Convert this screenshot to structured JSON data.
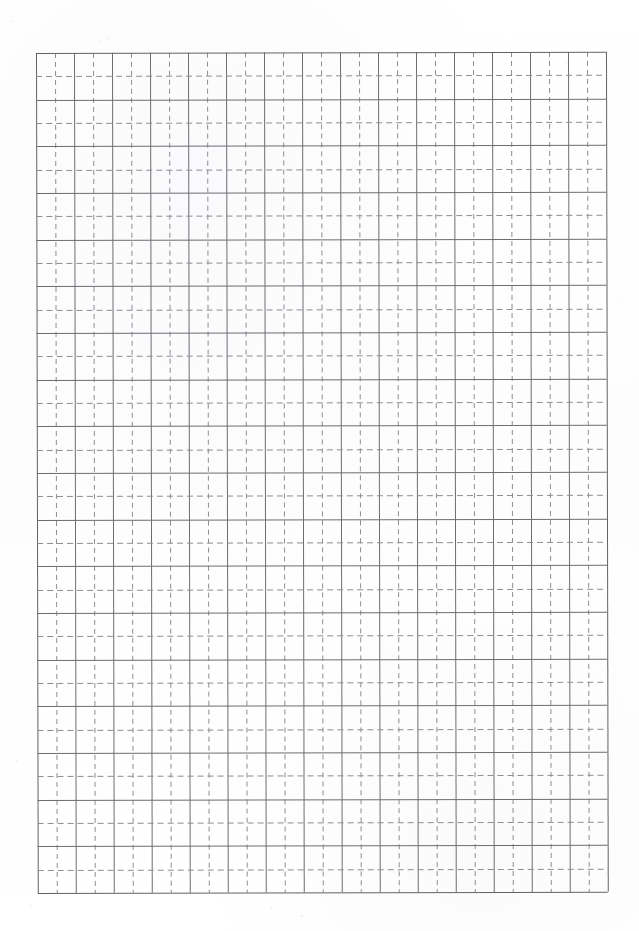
{
  "document": {
    "kind": "grid-paper-scan",
    "title": "Blank quadrille grid paper",
    "background_color": "#ffffff",
    "page_width_px": 639,
    "page_height_px": 931,
    "text_content": "",
    "handwriting": "",
    "printed_labels": []
  },
  "grid": {
    "origin_x_px": 36,
    "origin_y_px": 53,
    "width_px": 570,
    "height_px": 840,
    "major_columns": 15,
    "major_rows": 18,
    "major_cell_width_px": 38,
    "major_cell_height_px": 46.6667,
    "minor_divisions_per_major": 2,
    "major_line_color": "#6e6e72",
    "minor_line_color": "#8d8d92",
    "border_color": "#636367",
    "major_line_style": "solid",
    "minor_line_style": "dashed",
    "minor_dash_length_px": 6,
    "minor_gap_length_px": 4,
    "skew_degrees": -0.12
  },
  "artifacts": {
    "description": "faint scanner speckles on blank paper",
    "specks": [
      {
        "x": 106,
        "y": 37,
        "w": 3,
        "h": 3
      },
      {
        "x": 99,
        "y": 40,
        "w": 2,
        "h": 2
      },
      {
        "x": 10,
        "y": 20,
        "w": 2,
        "h": 2
      },
      {
        "x": 612,
        "y": 610,
        "w": 2,
        "h": 2
      },
      {
        "x": 300,
        "y": 915,
        "w": 3,
        "h": 2
      },
      {
        "x": 270,
        "y": 907,
        "w": 2,
        "h": 2
      },
      {
        "x": 30,
        "y": 905,
        "w": 2,
        "h": 2
      },
      {
        "x": 565,
        "y": 62,
        "w": 2,
        "h": 2
      },
      {
        "x": 621,
        "y": 298,
        "w": 2,
        "h": 2
      },
      {
        "x": 16,
        "y": 760,
        "w": 2,
        "h": 2
      }
    ]
  }
}
